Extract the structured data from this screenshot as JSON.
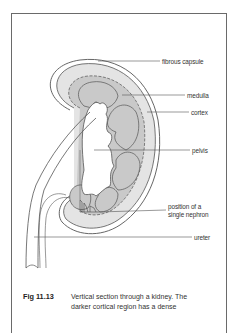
{
  "figure": {
    "number": "Fig 11.13",
    "caption_line1": "Vertical section through a kidney. The",
    "caption_line2": "darker cortical region has a dense"
  },
  "labels": {
    "fibrous_capsule": "fibrous capsule",
    "medulla": "medulla",
    "cortex": "cortex",
    "pelvis": "pelvis",
    "nephron_line1": "position of a",
    "nephron_line2": "single nephron",
    "ureter": "ureter"
  },
  "colors": {
    "cortex_fill": "#e4e4e4",
    "medulla_fill": "#c9c9c9",
    "line": "#555555",
    "frame": "#6a6a6a"
  }
}
